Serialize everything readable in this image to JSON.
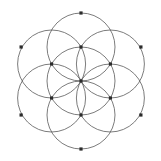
{
  "figure": {
    "name": "seed-of-life",
    "width": 161,
    "height": 161,
    "background_color": "#ffffff",
    "line_color": "#5a5a5a",
    "line_width": 0.8,
    "vertex_color": "#2b2b2b",
    "vertex_size": 3.2,
    "vertex_shape": "square"
  },
  "chart_data": {
    "type": "scatter",
    "subtitle": "",
    "xlabel": "",
    "ylabel": "",
    "xlim": [
      0,
      161
    ],
    "ylim": [
      0,
      161
    ],
    "grid": false,
    "legend": "none",
    "geometry": {
      "center": [
        81,
        81
      ],
      "radius": 34,
      "circle_count": 7,
      "vertex_count": 13,
      "hex_orientation": "pointy-top"
    },
    "circles": [
      {
        "id": "c0",
        "label": "center",
        "cx": 81,
        "cy": 81,
        "r": 34
      },
      {
        "id": "c1",
        "label": "north",
        "cx": 81,
        "cy": 47,
        "r": 34
      },
      {
        "id": "c2",
        "label": "northeast",
        "cx": 110.4,
        "cy": 64,
        "r": 34
      },
      {
        "id": "c3",
        "label": "southeast",
        "cx": 110.4,
        "cy": 98,
        "r": 34
      },
      {
        "id": "c4",
        "label": "south",
        "cx": 81,
        "cy": 115,
        "r": 34
      },
      {
        "id": "c5",
        "label": "southwest",
        "cx": 51.6,
        "cy": 98,
        "r": 34
      },
      {
        "id": "c6",
        "label": "northwest",
        "cx": 51.6,
        "cy": 64,
        "r": 34
      }
    ],
    "vertices": [
      {
        "id": "v0",
        "label": "center",
        "x": 81,
        "y": 81
      },
      {
        "id": "v1",
        "label": "inner-north",
        "x": 81,
        "y": 47
      },
      {
        "id": "v2",
        "label": "inner-northeast",
        "x": 110.4,
        "y": 64
      },
      {
        "id": "v3",
        "label": "inner-southeast",
        "x": 110.4,
        "y": 98
      },
      {
        "id": "v4",
        "label": "inner-south",
        "x": 81,
        "y": 115
      },
      {
        "id": "v5",
        "label": "inner-southwest",
        "x": 51.6,
        "y": 98
      },
      {
        "id": "v6",
        "label": "inner-northwest",
        "x": 51.6,
        "y": 64
      },
      {
        "id": "v7",
        "label": "outer-north",
        "x": 81,
        "y": 13
      },
      {
        "id": "v8",
        "label": "outer-northeast",
        "x": 140.9,
        "y": 47
      },
      {
        "id": "v9",
        "label": "outer-southeast",
        "x": 140.9,
        "y": 115
      },
      {
        "id": "v10",
        "label": "outer-south",
        "x": 81,
        "y": 149
      },
      {
        "id": "v11",
        "label": "outer-southwest",
        "x": 21.1,
        "y": 115
      },
      {
        "id": "v12",
        "label": "outer-northwest",
        "x": 21.1,
        "y": 47
      }
    ]
  }
}
